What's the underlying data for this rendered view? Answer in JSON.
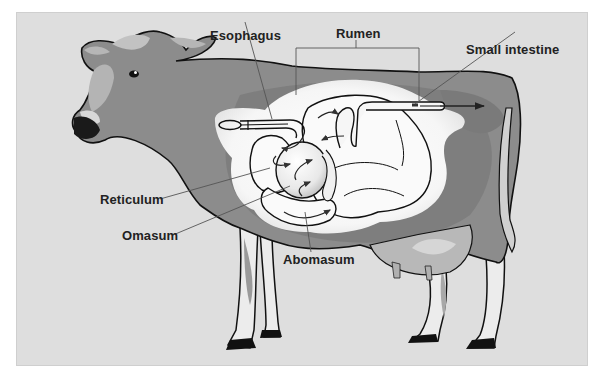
{
  "diagram": {
    "labels": {
      "esophagus": "Esophagus",
      "rumen": "Rumen",
      "small_intestine": "Small intestine",
      "reticulum": "Reticulum",
      "omasum": "Omasum",
      "abomasum": "Abomasum"
    },
    "colors": {
      "background": "#dedede",
      "body": "#8c8c8c",
      "body_shadow": "#7a7a7a",
      "light_patch": "#b4b4b4",
      "stomach_glow": "#f4f4f4",
      "outline": "#111111",
      "leader_line": "#555555"
    }
  }
}
